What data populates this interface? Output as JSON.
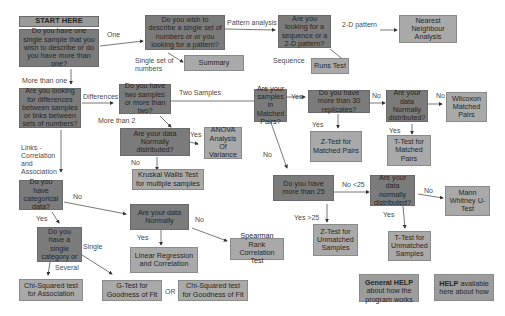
{
  "start": {
    "label": "START HERE"
  },
  "questions": {
    "one_or_more": "Do you have one single sample that you wish to describe or do you have more than one?",
    "describe_or_pattern": "Do you wish to describe a single set of numbers or or you looking for a pattern?",
    "sequence_or_2d": "Are you looking for a sequence or a 2-D pattern?",
    "differences_or_links": "Are you looking for differences between samples or links between sets of numbers?",
    "two_or_more": "Do you have two samples or more than two?",
    "normal_more_than_2": "Are your data Normally distributed?",
    "matched_pairs": "Are your samples in Matched Pairs?",
    "more_than_30": "Do you have more than 30 replicates?",
    "normal_matched": "Are your data Normally distributed?",
    "categorical": "Do you have categorical data?",
    "normal_links": "Are your data Normally",
    "more_than_25": "Do you have more than 25",
    "normal_unmatched": "Are your data normally distributed?",
    "single_category": "Do you have a single category or"
  },
  "results": {
    "nearest_neighbour": "Nearest Neighbour Analysis",
    "summary": "Summary",
    "runs_test": "Runs Test",
    "anova": "ANOVA Analysis Of Variance",
    "kruskal_wallis": "Kruskal Wallis Test for multiple samples",
    "wilcoxon": "Wilcoxon Matched Pairs",
    "z_test_matched": "Z-Test for Matched Pairs",
    "t_test_matched": "T-Test for Matched Pairs",
    "mann_whitney": "Mann Whitney U-Test",
    "z_test_unmatched": "Z-Test for Unmatched Samples",
    "t_test_unmatched": "T-Test for Unmatched Samples",
    "linear_regression": "Linear Regression and Correlation",
    "spearman": "Spearman Rank Correlation Test",
    "chi_association": "Chi-Squared test for Association",
    "g_test": "G-Test for Goodness of Fit",
    "chi_goodness": "Chi-Squared test for Goodness of Fit"
  },
  "help": {
    "general_bold": "General HELP",
    "general_rest": "about how the program works",
    "available_bold": "HELP",
    "available_rest": " available here about how"
  },
  "edge_labels": {
    "one": "One",
    "more_than_one": "More than one",
    "pattern_analysis": "Pattern analysis",
    "single_set": "Single set of numbers",
    "two_d_pattern": "2-D pattern",
    "sequence": "Sequence",
    "differences": "Differences",
    "two_samples": "Two Samples",
    "more_than_2": "More than 2",
    "yes_anova": "Yes",
    "no_kruskal": "No",
    "links": "Links - Correlation and Association",
    "yes_matched": "Yes",
    "no_matched": "No",
    "no_30": "No",
    "yes_30": "Yes",
    "no_normal_matched": "No",
    "yes_normal_matched": "Yes",
    "no_lt25": "No <25",
    "yes_gt25": "Yes >25",
    "no_normal_unmatched": "No",
    "yes_normal_unmatched": "Yes",
    "no_categorical": "No",
    "yes_categorical": "Yes",
    "yes_normal_links": "Yes",
    "no_normal_links": "No",
    "single": "Single",
    "several": "Several",
    "or": "OR"
  }
}
